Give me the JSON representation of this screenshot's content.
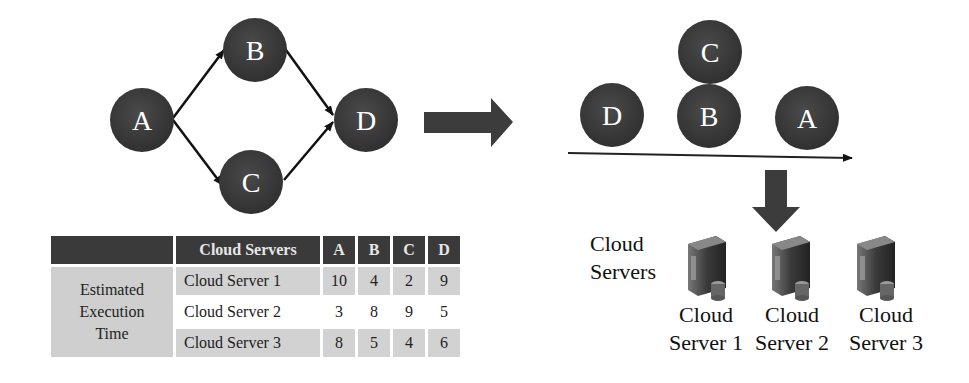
{
  "dag": {
    "nodes": [
      {
        "id": "A",
        "label": "A"
      },
      {
        "id": "B",
        "label": "B"
      },
      {
        "id": "C",
        "label": "C"
      },
      {
        "id": "D",
        "label": "D"
      }
    ],
    "edges": [
      [
        "A",
        "B"
      ],
      [
        "A",
        "C"
      ],
      [
        "B",
        "D"
      ],
      [
        "C",
        "D"
      ]
    ]
  },
  "schedule": {
    "order_labels": {
      "d": "D",
      "b": "B",
      "c": "C",
      "a": "A"
    }
  },
  "table": {
    "row_header": "Estimated Execution Time",
    "row_header_lines": [
      "Estimated",
      "Execution",
      "Time"
    ],
    "columns": [
      "Cloud Servers",
      "A",
      "B",
      "C",
      "D"
    ],
    "rows": [
      {
        "server": "Cloud Server 1",
        "values": [
          "10",
          "4",
          "2",
          "9"
        ]
      },
      {
        "server": "Cloud Server 2",
        "values": [
          "3",
          "8",
          "9",
          "5"
        ]
      },
      {
        "server": "Cloud Server 3",
        "values": [
          "8",
          "5",
          "4",
          "6"
        ]
      }
    ]
  },
  "servers": {
    "group_label_lines": [
      "Cloud",
      "Servers"
    ],
    "items": [
      {
        "line1": "Cloud",
        "line2": "Server 1"
      },
      {
        "line1": "Cloud",
        "line2": "Server 2"
      },
      {
        "line1": "Cloud",
        "line2": "Server 3"
      }
    ]
  },
  "colors": {
    "node": "#3a3a3a",
    "arrow": "#3c3c3c",
    "table_header": "#3a3a3a",
    "table_shade": "#d2d2d2"
  }
}
